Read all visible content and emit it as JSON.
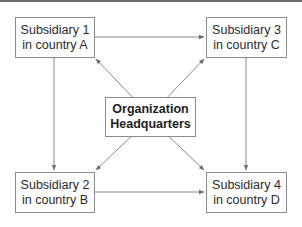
{
  "diagram": {
    "type": "organization-network",
    "headquarters": {
      "line1": "Organization",
      "line2": "Headquarters"
    },
    "subsidiaries": [
      {
        "id": 1,
        "line1": "Subsidiary 1",
        "line2": "in country A"
      },
      {
        "id": 2,
        "line1": "Subsidiary 2",
        "line2": "in country B"
      },
      {
        "id": 3,
        "line1": "Subsidiary 3",
        "line2": "in country C"
      },
      {
        "id": 4,
        "line1": "Subsidiary 4",
        "line2": "in country D"
      }
    ],
    "connections": [
      {
        "from": "Subsidiary 1",
        "to": "Subsidiary 3",
        "direction": "bidirectional"
      },
      {
        "from": "Subsidiary 2",
        "to": "Subsidiary 4",
        "direction": "bidirectional"
      },
      {
        "from": "Subsidiary 1",
        "to": "Subsidiary 2",
        "direction": "bidirectional"
      },
      {
        "from": "Subsidiary 3",
        "to": "Subsidiary 4",
        "direction": "bidirectional"
      },
      {
        "from": "Organization Headquarters",
        "to": "Subsidiary 1",
        "direction": "to"
      },
      {
        "from": "Organization Headquarters",
        "to": "Subsidiary 2",
        "direction": "to"
      },
      {
        "from": "Organization Headquarters",
        "to": "Subsidiary 3",
        "direction": "to"
      },
      {
        "from": "Organization Headquarters",
        "to": "Subsidiary 4",
        "direction": "to"
      }
    ],
    "colors": {
      "line": "#7a7a7a",
      "border": "#8a8a8a",
      "text": "#2a2a2a",
      "top_rule": "#6a6a6a"
    }
  }
}
